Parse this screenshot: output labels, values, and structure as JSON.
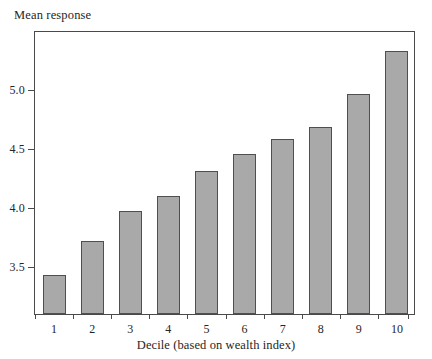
{
  "chart_data": {
    "type": "bar",
    "title": "",
    "ylabel": "Mean response",
    "xlabel": "Decile (based on wealth index)",
    "categories": [
      "1",
      "2",
      "3",
      "4",
      "5",
      "6",
      "7",
      "8",
      "9",
      "10"
    ],
    "values": [
      3.42,
      3.71,
      3.96,
      4.09,
      4.3,
      4.44,
      4.57,
      4.67,
      4.95,
      5.31
    ],
    "ytick_labels": [
      "3.5",
      "4.0",
      "4.5",
      "5.0"
    ],
    "ytick_values": [
      3.5,
      4.0,
      4.5,
      5.0
    ],
    "ylim": [
      3.09,
      5.49
    ],
    "xlim_categories": 10,
    "grid": false,
    "legend": null,
    "bar_fill_color": "#a9a9a9",
    "bar_edge_color": "#4f4f4f",
    "axis_color": "#4a4a4a",
    "background_color": "#ffffff"
  }
}
